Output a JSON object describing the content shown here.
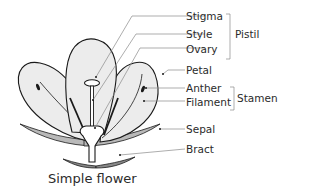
{
  "diagram": {
    "title": "Simple flower",
    "labels": {
      "stigma": "Stigma",
      "style": "Style",
      "ovary": "Ovary",
      "petal": "Petal",
      "anther": "Anther",
      "filament": "Filament",
      "sepal": "Sepal",
      "bract": "Bract"
    },
    "groups": {
      "pistil": "Pistil",
      "stamen": "Stamen"
    },
    "colors": {
      "petal_fill": "#ececec",
      "sepal_fill": "#b9b9b9",
      "outline": "#1a1a1a",
      "leader_line": "#8a8a8a",
      "text": "#2b2b2b"
    }
  }
}
